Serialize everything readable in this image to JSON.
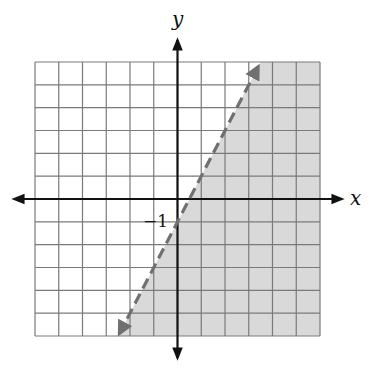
{
  "chart_data": {
    "type": "inequality-graph",
    "title": "",
    "xlabel": "x",
    "ylabel": "y",
    "xlim": [
      -6,
      6
    ],
    "ylim": [
      -6,
      6
    ],
    "grid": true,
    "grid_step": 1,
    "annotations": [
      {
        "text": "−1",
        "at": [
          0,
          -1
        ],
        "meaning": "y-intercept label"
      }
    ],
    "boundary_line": {
      "equation": "y = 2x - 1",
      "slope": 2,
      "y_intercept": -1,
      "style": "dashed",
      "arrow_ends": [
        [
          3.4,
          5.8
        ],
        [
          -2.45,
          -5.9
        ]
      ]
    },
    "shaded_region": {
      "inequality": "y < 2x - 1",
      "side": "below-right of line",
      "color": "#d9d9d9"
    },
    "colors": {
      "grid": "#7a7a7a",
      "axes": "#111111",
      "line": "#707070",
      "shade": "#d9d9d9"
    }
  },
  "labels": {
    "x_axis": "x",
    "y_axis": "y",
    "intercept": "−1"
  }
}
